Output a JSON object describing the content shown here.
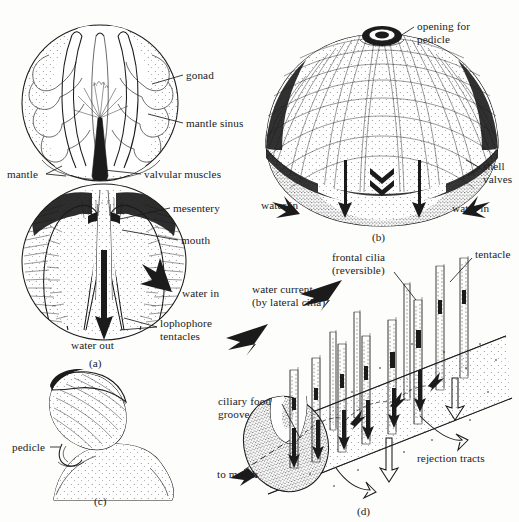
{
  "figure": {
    "style": "black-and-white pen-and-ink scientific illustration",
    "background_color": "#fdfdfb",
    "ink_color": "#1b1b1b"
  },
  "panels": [
    {
      "id": "a",
      "caption": "(a)",
      "description": "Internal anatomy of brachiopod, valves removed, showing lophophore",
      "labels": [
        {
          "name": "gonad",
          "text": "gonad",
          "x": 186,
          "y": 70
        },
        {
          "name": "mantle-sinus",
          "text": "mantle sinus",
          "x": 186,
          "y": 118
        },
        {
          "name": "mantle",
          "text": "mantle",
          "x": 7,
          "y": 169
        },
        {
          "name": "valvular-muscles",
          "text": "valvular muscles",
          "x": 144,
          "y": 169
        },
        {
          "name": "mesentery",
          "text": "mesentery",
          "x": 173,
          "y": 203
        },
        {
          "name": "mouth",
          "text": "mouth",
          "x": 181,
          "y": 235
        },
        {
          "name": "water-in",
          "text": "water in",
          "x": 182,
          "y": 288
        },
        {
          "name": "lophophore-tentacles",
          "text": "lophophore\ntentacles",
          "x": 160,
          "y": 318
        },
        {
          "name": "water-out",
          "text": "water out",
          "x": 71,
          "y": 340
        }
      ]
    },
    {
      "id": "b",
      "caption": "(b)",
      "description": "External view of articulate brachiopod shell with pedicle opening",
      "labels": [
        {
          "name": "opening-for-pedicle",
          "text": "opening for\npedicle",
          "x": 417,
          "y": 21
        },
        {
          "name": "shell-valves",
          "text": "shell\nvalves",
          "x": 483,
          "y": 161
        },
        {
          "name": "water-in-left",
          "text": "water in",
          "x": 261,
          "y": 200
        },
        {
          "name": "water-in-right",
          "text": "water in",
          "x": 452,
          "y": 203
        }
      ]
    },
    {
      "id": "c",
      "caption": "(c)",
      "description": "Whole brachiopod attached to rock substrate by pedicle",
      "labels": [
        {
          "name": "pedicle",
          "text": "pedicle",
          "x": 12,
          "y": 442
        }
      ]
    },
    {
      "id": "d",
      "caption": "(d)",
      "description": "Detail of lophophore tentacles, ciliary currents and food groove",
      "labels": [
        {
          "name": "frontal-cilia",
          "text": "frontal cilia\n(reversible)",
          "x": 332,
          "y": 252
        },
        {
          "name": "tentacle",
          "text": "tentacle",
          "x": 475,
          "y": 249
        },
        {
          "name": "water-current",
          "text": "water current\n(by lateral cilia)",
          "x": 252,
          "y": 284
        },
        {
          "name": "ciliary-food-groove",
          "text": "ciliary food\ngroove",
          "x": 218,
          "y": 396
        },
        {
          "name": "rejection-tracts",
          "text": "rejection tracts",
          "x": 417,
          "y": 453
        },
        {
          "name": "to-mouth",
          "text": "to mouth",
          "x": 217,
          "y": 469
        }
      ]
    }
  ],
  "panel_captions": {
    "a": {
      "text": "(a)",
      "x": 89,
      "y": 358
    },
    "b": {
      "text": "(b)",
      "x": 372,
      "y": 232
    },
    "c": {
      "text": "(c)",
      "x": 94,
      "y": 496
    },
    "d": {
      "text": "(d)",
      "x": 357,
      "y": 506
    }
  }
}
